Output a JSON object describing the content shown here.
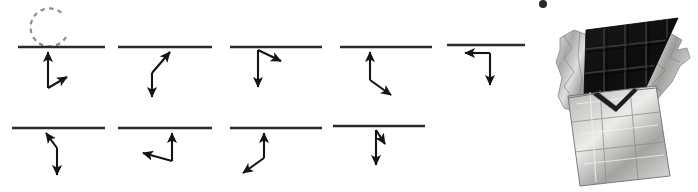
{
  "figure": {
    "background_color": "#ffffff",
    "width": 698,
    "height": 192,
    "line_color": "#2b2b2b",
    "vector_color": "#141414",
    "dashed_arc_color": "#8d8d8d"
  },
  "diagram": {
    "rows": 2,
    "panels": [
      {
        "id": "panel-1",
        "row": 1,
        "column": 1,
        "surface_line": {
          "x1": 18,
          "y1": 47,
          "x2": 105,
          "y2": 47
        },
        "dashed_arc": {
          "cx": 50,
          "cy": 27,
          "r": 19,
          "opening": "right"
        },
        "arrows": [
          {
            "name": "up-arrow",
            "x1": 48,
            "y1": 88,
            "x2": 48,
            "y2": 49,
            "direction": "up"
          },
          {
            "name": "diagonal-up-right-arrow",
            "x1": 48,
            "y1": 88,
            "x2": 70,
            "y2": 75,
            "direction": "up-right"
          }
        ]
      },
      {
        "id": "panel-2",
        "row": 1,
        "column": 2,
        "surface_line": {
          "x1": 118,
          "y1": 47,
          "x2": 212,
          "y2": 47
        },
        "dashed_arc": null,
        "arrows": [
          {
            "name": "diagonal-up-right-arrow",
            "x1": 152,
            "y1": 73,
            "x2": 172,
            "y2": 50,
            "direction": "up-right"
          },
          {
            "name": "down-arrow",
            "x1": 152,
            "y1": 73,
            "x2": 152,
            "y2": 100,
            "direction": "down"
          }
        ]
      },
      {
        "id": "panel-3",
        "row": 1,
        "column": 3,
        "surface_line": {
          "x1": 230,
          "y1": 47,
          "x2": 322,
          "y2": 47
        },
        "dashed_arc": null,
        "arrows": [
          {
            "name": "diagonal-down-right-arrow",
            "x1": 258,
            "y1": 50,
            "x2": 283,
            "y2": 62,
            "direction": "down-right"
          },
          {
            "name": "down-arrow",
            "x1": 258,
            "y1": 50,
            "x2": 258,
            "y2": 90,
            "direction": "down"
          }
        ]
      },
      {
        "id": "panel-4",
        "row": 1,
        "column": 4,
        "surface_line": {
          "x1": 340,
          "y1": 47,
          "x2": 432,
          "y2": 47
        },
        "dashed_arc": null,
        "arrows": [
          {
            "name": "up-arrow",
            "x1": 370,
            "y1": 80,
            "x2": 370,
            "y2": 50,
            "direction": "up"
          },
          {
            "name": "diagonal-down-right-arrow",
            "x1": 370,
            "y1": 80,
            "x2": 393,
            "y2": 97,
            "direction": "down-right"
          }
        ]
      },
      {
        "id": "panel-5",
        "row": 1,
        "column": 5,
        "surface_line": {
          "x1": 447,
          "y1": 45,
          "x2": 525,
          "y2": 45
        },
        "dashed_arc": null,
        "arrows": [
          {
            "name": "left-arrow",
            "x1": 490,
            "y1": 53,
            "x2": 463,
            "y2": 53,
            "direction": "left"
          },
          {
            "name": "down-arrow",
            "x1": 490,
            "y1": 53,
            "x2": 490,
            "y2": 87,
            "direction": "down"
          }
        ]
      },
      {
        "id": "panel-6",
        "row": 2,
        "column": 1,
        "surface_line": {
          "x1": 12,
          "y1": 128,
          "x2": 105,
          "y2": 128
        },
        "dashed_arc": null,
        "arrows": [
          {
            "name": "diagonal-up-left-arrow",
            "x1": 57,
            "y1": 148,
            "x2": 45,
            "y2": 131,
            "direction": "up-left"
          },
          {
            "name": "down-arrow",
            "x1": 57,
            "y1": 148,
            "x2": 57,
            "y2": 177,
            "direction": "down"
          }
        ]
      },
      {
        "id": "panel-7",
        "row": 2,
        "column": 2,
        "surface_line": {
          "x1": 118,
          "y1": 128,
          "x2": 212,
          "y2": 128
        },
        "dashed_arc": null,
        "arrows": [
          {
            "name": "up-arrow",
            "x1": 172,
            "y1": 161,
            "x2": 172,
            "y2": 131,
            "direction": "up"
          },
          {
            "name": "left-arrow",
            "x1": 172,
            "y1": 161,
            "x2": 141,
            "y2": 152,
            "direction": "left"
          }
        ]
      },
      {
        "id": "panel-8",
        "row": 2,
        "column": 3,
        "surface_line": {
          "x1": 230,
          "y1": 128,
          "x2": 322,
          "y2": 128
        },
        "dashed_arc": null,
        "arrows": [
          {
            "name": "up-arrow",
            "x1": 264,
            "y1": 158,
            "x2": 264,
            "y2": 131,
            "direction": "up"
          },
          {
            "name": "diagonal-down-left-arrow",
            "x1": 264,
            "y1": 158,
            "x2": 241,
            "y2": 175,
            "direction": "down-left"
          }
        ]
      },
      {
        "id": "panel-9",
        "row": 2,
        "column": 4,
        "surface_line": {
          "x1": 333,
          "y1": 126,
          "x2": 425,
          "y2": 126
        },
        "dashed_arc": null,
        "arrows": [
          {
            "name": "down-arrow",
            "x1": 376,
            "y1": 130,
            "x2": 376,
            "y2": 168,
            "direction": "down"
          },
          {
            "name": "short-diagonal-down-right-arrow",
            "x1": 376,
            "y1": 130,
            "x2": 386,
            "y2": 146,
            "direction": "down-right"
          }
        ]
      }
    ]
  },
  "photo": {
    "name": "chocolate-bar-photo",
    "subject": "dark chocolate bar partially unwrapped in silver foil",
    "grayscale": true,
    "chocolate_color": "#141414",
    "foil_light": "#d8d8d6",
    "foil_mid": "#b4b4b2",
    "foil_dark": "#8a8a88",
    "grid": {
      "columns": 4,
      "rows": 4
    }
  }
}
